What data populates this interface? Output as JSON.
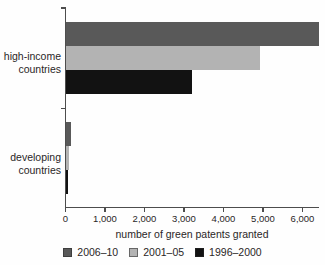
{
  "chart_data": {
    "type": "bar",
    "orientation": "horizontal",
    "title": "",
    "xlabel": "number of green patents granted",
    "ylabel": "",
    "categories": [
      "high-income countries",
      "developing countries"
    ],
    "series": [
      {
        "name": "2006–10",
        "color": "#595959",
        "values": [
          6400,
          130
        ]
      },
      {
        "name": "2001–05",
        "color": "#b3b3b3",
        "values": [
          4900,
          80
        ]
      },
      {
        "name": "1996–2000",
        "color": "#121212",
        "values": [
          3200,
          60
        ]
      }
    ],
    "xlim": [
      0,
      6000
    ],
    "xticks": [
      0,
      1000,
      2000,
      3000,
      4000,
      5000,
      6000
    ],
    "xtick_labels": [
      "0",
      "1,000",
      "2,000",
      "3,000",
      "4,000",
      "5,000",
      "6,000"
    ],
    "grid": false,
    "legend_position": "bottom"
  },
  "colors": {
    "axis": "#4d4d4d",
    "text": "#2a2627",
    "background": "#fefefe"
  }
}
